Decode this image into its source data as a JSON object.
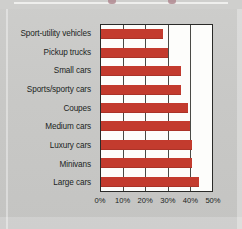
{
  "chart_data": {
    "type": "bar",
    "orientation": "horizontal",
    "title": "",
    "xlabel": "",
    "ylabel": "",
    "xlim": [
      0,
      50
    ],
    "grid": true,
    "legend": false,
    "categories": [
      "Sport-utility vehicles",
      "Pickup trucks",
      "Small cars",
      "Sports/sporty cars",
      "Coupes",
      "Medium cars",
      "Luxury cars",
      "Minivans",
      "Large cars"
    ],
    "values": [
      28,
      30,
      36,
      36,
      39,
      40,
      41,
      41,
      44
    ],
    "tick_labels": [
      "0%",
      "10%",
      "20%",
      "30%",
      "40%",
      "50%"
    ],
    "tick_values": [
      0,
      10,
      20,
      30,
      40,
      50
    ],
    "bar_color": "#c33b2e",
    "plot_background": "#fdfdfb",
    "axis_color": "#2a2a28",
    "page_background": "#c9c9c7"
  }
}
